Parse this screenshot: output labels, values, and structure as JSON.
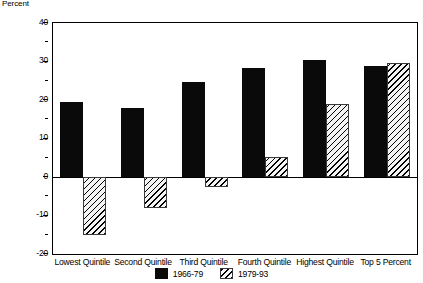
{
  "chart_data": {
    "type": "bar",
    "title": "",
    "subtitle": "",
    "xlabel": "",
    "ylabel": "Percent",
    "ylim": [
      -20,
      40
    ],
    "ytick_values": [
      -20,
      -10,
      0,
      10,
      20,
      30,
      40
    ],
    "ytick_labels": [
      "-20",
      "-10",
      "0",
      "10",
      "20",
      "30",
      "40"
    ],
    "yminor_step": 5,
    "grid": false,
    "legend_position": "bottom-center",
    "categories": [
      "Lowest Quintile",
      "Second Quintile",
      "Third Quintile",
      "Fourth Quintile",
      "Highest Quintile",
      "Top 5 Percent"
    ],
    "series": [
      {
        "name": "1966-79",
        "fill": "solid-black",
        "color": "#0a0a0a",
        "values": [
          19.5,
          18.0,
          24.8,
          28.4,
          30.5,
          28.8
        ]
      },
      {
        "name": "1979-93",
        "fill": "diagonal-hatch",
        "color": "#ffffff",
        "values": [
          -15.0,
          -8.0,
          -2.5,
          5.2,
          19.0,
          29.7
        ]
      }
    ]
  },
  "legend": {
    "entries": [
      {
        "label": "1966-79"
      },
      {
        "label": "1979-93"
      }
    ]
  }
}
